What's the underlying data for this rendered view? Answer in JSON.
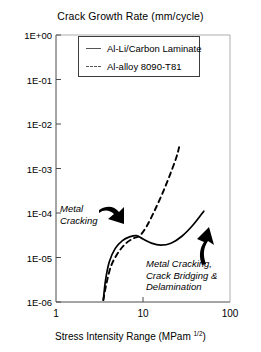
{
  "chart_data": {
    "type": "line",
    "title": "Crack Growth Rate (mm/cycle)",
    "xlabel_main": "Stress Intensity Range (MPam ",
    "xlabel_sup": "1/2",
    "xlabel_close": ")",
    "ylabel": "Crack Growth Rate (mm/cycle)",
    "xscale": "log",
    "yscale": "log",
    "xlim": [
      1,
      100
    ],
    "ylim": [
      1e-06,
      1
    ],
    "grid": false,
    "legend_position": "top-center",
    "xticks": [
      {
        "value": 1,
        "label": "1"
      },
      {
        "value": 10,
        "label": "10"
      },
      {
        "value": 100,
        "label": "100"
      }
    ],
    "yticks": [
      {
        "value": 1,
        "label": "1E+00"
      },
      {
        "value": 0.1,
        "label": "1E-01"
      },
      {
        "value": 0.01,
        "label": "1E-02"
      },
      {
        "value": 0.001,
        "label": "1E-03"
      },
      {
        "value": 0.0001,
        "label": "1E-04"
      },
      {
        "value": 1e-05,
        "label": "1E-05"
      },
      {
        "value": 1e-06,
        "label": "1E-06"
      }
    ],
    "series": [
      {
        "name": "Al-Li/Carbon Laminate",
        "style": "solid",
        "color": "#000000",
        "points": [
          {
            "x": 3.5,
            "y": 1.1e-06
          },
          {
            "x": 3.7,
            "y": 3e-06
          },
          {
            "x": 4.1,
            "y": 8e-06
          },
          {
            "x": 4.8,
            "y": 1.6e-05
          },
          {
            "x": 5.8,
            "y": 2.4e-05
          },
          {
            "x": 7.0,
            "y": 2.9e-05
          },
          {
            "x": 8.4,
            "y": 3.1e-05
          },
          {
            "x": 10.0,
            "y": 2.6e-05
          },
          {
            "x": 12.5,
            "y": 2.1e-05
          },
          {
            "x": 16.0,
            "y": 1.9e-05
          },
          {
            "x": 21.0,
            "y": 2.1e-05
          },
          {
            "x": 28.0,
            "y": 3e-05
          },
          {
            "x": 38.0,
            "y": 5.5e-05
          },
          {
            "x": 50.0,
            "y": 0.00011
          }
        ]
      },
      {
        "name": "Al-alloy 8090-T81",
        "style": "dashed",
        "color": "#000000",
        "points": [
          {
            "x": 3.5,
            "y": 1.1e-06
          },
          {
            "x": 3.8,
            "y": 2.6e-06
          },
          {
            "x": 4.3,
            "y": 6.5e-06
          },
          {
            "x": 5.2,
            "y": 1.3e-05
          },
          {
            "x": 6.4,
            "y": 2.1e-05
          },
          {
            "x": 7.8,
            "y": 2.7e-05
          },
          {
            "x": 9.2,
            "y": 3.1e-05
          },
          {
            "x": 11.0,
            "y": 5e-05
          },
          {
            "x": 13.5,
            "y": 0.00011
          },
          {
            "x": 16.5,
            "y": 0.00026
          },
          {
            "x": 20.0,
            "y": 0.00065
          },
          {
            "x": 24.0,
            "y": 0.0017
          },
          {
            "x": 26.0,
            "y": 0.003
          }
        ]
      }
    ],
    "annotations": [
      {
        "name": "metal-cracking",
        "lines": [
          "Metal",
          "Cracking"
        ],
        "arrow": "curved-down-right"
      },
      {
        "name": "metal-cracking-bridging-delamination",
        "lines": [
          "Metal Cracking,",
          "Crack Bridging &",
          "Delamination"
        ],
        "arrow": "curved-up-left"
      }
    ]
  },
  "legend": {
    "items": [
      {
        "label": "Al-Li/Carbon Laminate",
        "style": "solid"
      },
      {
        "label": "Al-alloy 8090-T81",
        "style": "dashed"
      }
    ]
  }
}
